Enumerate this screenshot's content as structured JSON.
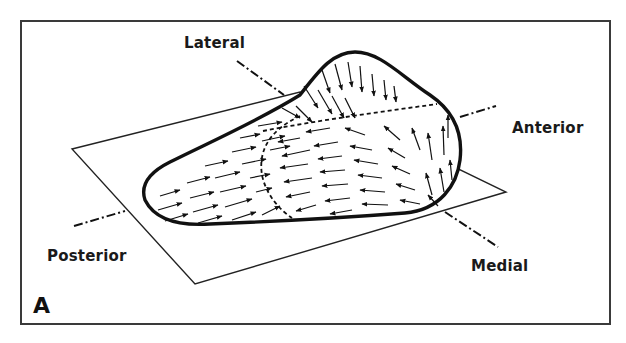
{
  "figure": {
    "panel_label": "A",
    "labels": {
      "lateral": "Lateral",
      "anterior": "Anterior",
      "posterior": "Posterior",
      "medial": "Medial"
    },
    "colors": {
      "line": "#111111",
      "frame": "#3a3a3a",
      "background": "#ffffff"
    }
  }
}
